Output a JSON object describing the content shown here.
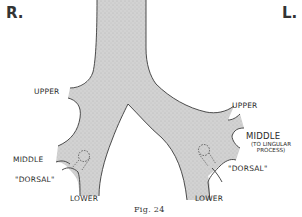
{
  "figure": {
    "caption": "Fig. 24",
    "side_labels": {
      "right": "R.",
      "left": "L."
    },
    "right_lung": {
      "upper": "UPPER",
      "middle": "MIDDLE",
      "dorsal": "\"DORSAL\"",
      "lower": "LOWER"
    },
    "left_lung": {
      "upper": "UPPER",
      "middle": "MIDDLE",
      "middle_note_line1": "(TO LINGULAR",
      "middle_note_line2": "PROCESS)",
      "dorsal": "\"DORSAL\"",
      "lower": "LOWER"
    },
    "colors": {
      "airway_fill": "#cfcfcf",
      "outline": "#3a3a3a",
      "text": "#2a2a2a"
    }
  }
}
